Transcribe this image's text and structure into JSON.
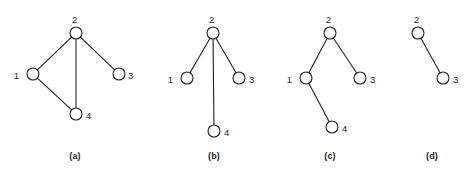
{
  "figure": {
    "background_color": "#ffffff",
    "stroke_color": "#231f20",
    "node_fill_color": "#ffffff",
    "node_radius": 6,
    "edge_width": 1.1,
    "node_stroke_width": 1.1
  },
  "panels": [
    {
      "id": "a",
      "caption": "(a)",
      "caption_x": 75,
      "caption_y": 152,
      "origin_x": 0,
      "width": 130,
      "nodes": [
        {
          "id": "1",
          "label": "1",
          "x": 33,
          "y": 74,
          "label_x": 19,
          "label_y": 71,
          "label_align": "right"
        },
        {
          "id": "2",
          "label": "2",
          "x": 76,
          "y": 33,
          "label_x": 72,
          "label_y": 15,
          "label_align": "left"
        },
        {
          "id": "3",
          "label": "3",
          "x": 119,
          "y": 74,
          "label_x": 128,
          "label_y": 71,
          "label_align": "left"
        },
        {
          "id": "4",
          "label": "4",
          "x": 76,
          "y": 114,
          "label_x": 86,
          "label_y": 111,
          "label_align": "left"
        }
      ],
      "edges": [
        {
          "from": "2",
          "to": "1"
        },
        {
          "from": "2",
          "to": "3"
        },
        {
          "from": "2",
          "to": "4"
        },
        {
          "from": "1",
          "to": "4"
        }
      ]
    },
    {
      "id": "b",
      "caption": "(b)",
      "caption_x": 214,
      "caption_y": 152,
      "origin_x": 130,
      "width": 120,
      "nodes": [
        {
          "id": "1",
          "label": "1",
          "x": 57,
          "y": 78,
          "label_x": 43,
          "label_y": 75,
          "label_align": "right"
        },
        {
          "id": "2",
          "label": "2",
          "x": 83,
          "y": 33,
          "label_x": 79,
          "label_y": 15,
          "label_align": "left"
        },
        {
          "id": "3",
          "label": "3",
          "x": 109,
          "y": 78,
          "label_x": 119,
          "label_y": 75,
          "label_align": "left"
        },
        {
          "id": "4",
          "label": "4",
          "x": 84,
          "y": 131,
          "label_x": 94,
          "label_y": 128,
          "label_align": "left"
        }
      ],
      "edges": [
        {
          "from": "2",
          "to": "1"
        },
        {
          "from": "2",
          "to": "3"
        },
        {
          "from": "2",
          "to": "4"
        }
      ]
    },
    {
      "id": "c",
      "caption": "(c)",
      "caption_x": 330,
      "caption_y": 152,
      "origin_x": 250,
      "width": 120,
      "nodes": [
        {
          "id": "1",
          "label": "1",
          "x": 56,
          "y": 78,
          "label_x": 42,
          "label_y": 75,
          "label_align": "right"
        },
        {
          "id": "2",
          "label": "2",
          "x": 80,
          "y": 33,
          "label_x": 76,
          "label_y": 15,
          "label_align": "left"
        },
        {
          "id": "3",
          "label": "3",
          "x": 110,
          "y": 78,
          "label_x": 120,
          "label_y": 75,
          "label_align": "left"
        },
        {
          "id": "4",
          "label": "4",
          "x": 82,
          "y": 127,
          "label_x": 92,
          "label_y": 124,
          "label_align": "left"
        }
      ],
      "edges": [
        {
          "from": "2",
          "to": "1"
        },
        {
          "from": "2",
          "to": "3"
        },
        {
          "from": "1",
          "to": "4"
        }
      ]
    },
    {
      "id": "d",
      "caption": "(d)",
      "caption_x": 432,
      "caption_y": 152,
      "origin_x": 370,
      "width": 106,
      "nodes": [
        {
          "id": "2",
          "label": "2",
          "x": 48,
          "y": 33,
          "label_x": 44,
          "label_y": 15,
          "label_align": "left"
        },
        {
          "id": "3",
          "label": "3",
          "x": 73,
          "y": 78,
          "label_x": 83,
          "label_y": 75,
          "label_align": "left"
        }
      ],
      "edges": [
        {
          "from": "2",
          "to": "3"
        }
      ]
    }
  ]
}
